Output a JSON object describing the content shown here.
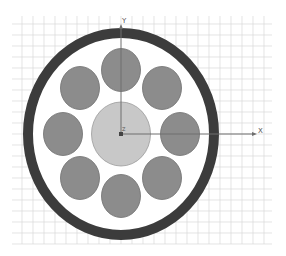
{
  "diagram": {
    "title": "",
    "colors": {
      "background": "#ffffff",
      "grid": "#d9d9d9",
      "axis": "#6e6e6e",
      "outer_ring": "#3c3c3c",
      "inner_fill": "#ffffff",
      "center_conductor": "#c8c8c8",
      "center_conductor_stroke": "#9a9a9a",
      "strand": "#8c8c8c",
      "strand_stroke": "#6f6f6f"
    },
    "grid": {
      "x_start": 12,
      "x_end": 272,
      "y_start": 16,
      "y_end": 244,
      "spacing": 11
    },
    "axes": {
      "origin": {
        "x": 121,
        "y": 134
      },
      "x_end": 257,
      "y_end": 24,
      "x_label": "X",
      "y_label": "Y",
      "z_label": "Z"
    },
    "outer_ring": {
      "cx": 121,
      "cy": 134,
      "rx": 93,
      "ry": 101,
      "thickness": 10
    },
    "center_conductor": {
      "cx": 121,
      "cy": 134,
      "rx": 29.5,
      "ry": 32
    },
    "strands": [
      {
        "name": "strand-top",
        "cx": 121,
        "cy": 70,
        "rx": 19.5,
        "ry": 21.5
      },
      {
        "name": "strand-top-right",
        "cx": 162,
        "cy": 88,
        "rx": 19.5,
        "ry": 21.5
      },
      {
        "name": "strand-right",
        "cx": 180,
        "cy": 134,
        "rx": 19.5,
        "ry": 21.5
      },
      {
        "name": "strand-bottom-right",
        "cx": 162,
        "cy": 178,
        "rx": 19.5,
        "ry": 21.5
      },
      {
        "name": "strand-bottom",
        "cx": 121,
        "cy": 196,
        "rx": 19.5,
        "ry": 21.5
      },
      {
        "name": "strand-bottom-left",
        "cx": 80,
        "cy": 178,
        "rx": 19.5,
        "ry": 21.5
      },
      {
        "name": "strand-left",
        "cx": 63,
        "cy": 134,
        "rx": 19.5,
        "ry": 21.5
      },
      {
        "name": "strand-top-left",
        "cx": 80,
        "cy": 88,
        "rx": 19.5,
        "ry": 21.5
      }
    ]
  }
}
